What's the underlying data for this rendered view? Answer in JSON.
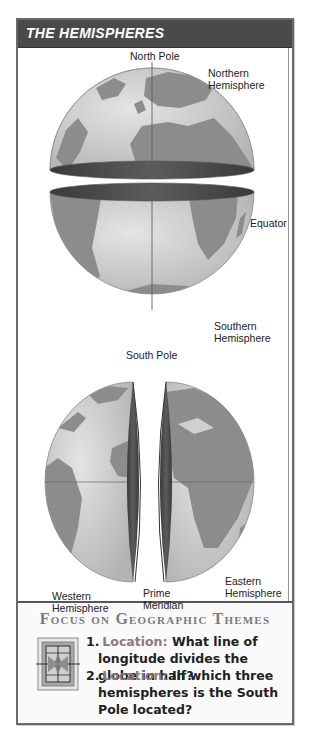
{
  "title": "THE HEMISPHERES",
  "top_diagram": {
    "labels": {
      "north_pole": "North Pole",
      "northern_hemisphere": [
        "Northern",
        "Hemisphere"
      ],
      "equator": "Equator",
      "southern_hemisphere": [
        "Southern",
        "Hemisphere"
      ],
      "south_pole": "South Pole"
    }
  },
  "bottom_diagram": {
    "labels": {
      "western_hemisphere": [
        "Western",
        "Hemisphere"
      ],
      "eastern_hemisphere": [
        "Eastern",
        "Hemisphere"
      ],
      "prime_meridian": [
        "Prime",
        "Meridian"
      ]
    }
  },
  "focus": {
    "title": "Focus on Geographic Themes",
    "icon": "compass-rose-icon",
    "questions": [
      {
        "number": "1.",
        "theme": "Location:",
        "text": "What line of longitude divides the globe in half?"
      },
      {
        "number": "2.",
        "theme": "Location:",
        "text": "In which three hemispheres is the South Pole located?"
      }
    ]
  },
  "colors": {
    "title_bar": "#4a4a4a",
    "ocean": "#d6d6d6",
    "land": "#8c8c8c",
    "cut_face": "#4d4d4d",
    "theme_label": "#8a7a7a"
  }
}
